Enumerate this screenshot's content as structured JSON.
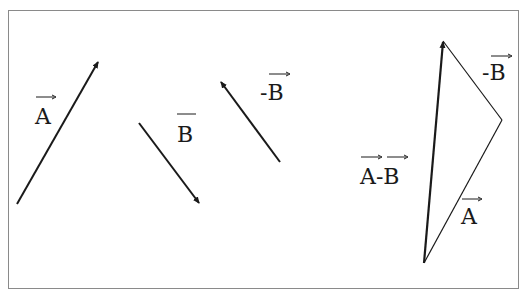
{
  "diagram": {
    "title": "",
    "colors": {
      "stroke": "#1a1a1a",
      "frame": "#8a8a8a"
    },
    "vectors": [
      {
        "id": "A",
        "label": "A",
        "role": "vector A"
      },
      {
        "id": "B",
        "label": "B",
        "role": "vector B"
      },
      {
        "id": "negB",
        "label": "-B",
        "role": "vector negative B"
      }
    ],
    "triangle": {
      "labels": {
        "negB": "-B",
        "A": "A",
        "AminusB": "A-B",
        "AminusB_parts": [
          "A",
          "-",
          "B"
        ]
      }
    }
  }
}
